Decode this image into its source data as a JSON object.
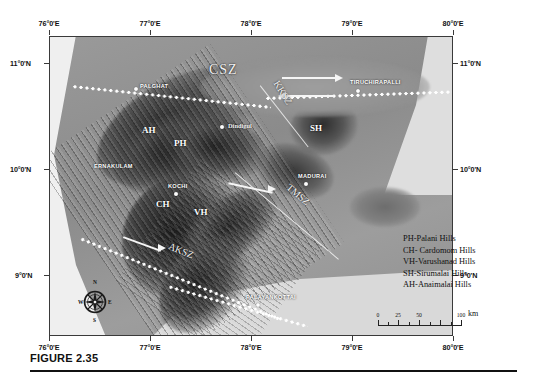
{
  "figure": {
    "caption": "FIGURE 2.35"
  },
  "axes": {
    "x_ticks": [
      "76°0'E",
      "77°0'E",
      "78°0'E",
      "79°0'E",
      "80°0'E"
    ],
    "y_ticks": [
      "11°0'N",
      "10°0'N",
      "9°0'N"
    ]
  },
  "map": {
    "cities": [
      {
        "name": "PALGHAT",
        "x": 134,
        "y": 78
      },
      {
        "name": "TIRUCHIRAPALLI",
        "x": 355,
        "y": 84
      },
      {
        "name": "Dindigul",
        "x": 222,
        "y": 122
      },
      {
        "name": "ERNAKULAM",
        "x": 120,
        "y": 166
      },
      {
        "name": "KOCHI",
        "x": 172,
        "y": 190
      },
      {
        "name": "MADURAI",
        "x": 310,
        "y": 177
      },
      {
        "name": "PALAYANKOTTAI",
        "x": 261,
        "y": 301
      }
    ],
    "hill_codes": [
      {
        "code": "AH",
        "x": 146,
        "y": 131
      },
      {
        "code": "PH",
        "x": 176,
        "y": 144
      },
      {
        "code": "CH",
        "x": 158,
        "y": 205
      },
      {
        "code": "VH",
        "x": 196,
        "y": 213
      },
      {
        "code": "SH",
        "x": 312,
        "y": 129
      }
    ],
    "shear_zones": [
      {
        "label": "CSZ",
        "x": 208,
        "y": 70
      },
      {
        "label": "KKSZ",
        "x": 272,
        "y": 96
      },
      {
        "label": "TMSZ",
        "x": 290,
        "y": 196
      },
      {
        "label": "AKSZ",
        "x": 175,
        "y": 255
      }
    ]
  },
  "legend": {
    "entries": [
      "PH-Palani Hills",
      "CH- Cardomom Hills",
      "VH-Varushanad Hills",
      "SH-Sirumalai Hills",
      "AH-Anaimalai Hills"
    ]
  },
  "scale": {
    "ticks": [
      "0",
      "25",
      "50",
      "100"
    ],
    "unit": "km"
  },
  "compass": {
    "north": "N",
    "east": "E",
    "south": "S",
    "west": "W"
  }
}
